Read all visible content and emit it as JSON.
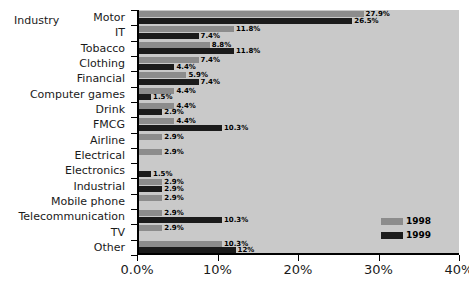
{
  "chart_data": {
    "type": "bar",
    "orientation": "horizontal",
    "title": "",
    "xlabel": "",
    "ylabel": "Industry",
    "xlim": [
      0,
      40
    ],
    "grid": false,
    "legend_position": "bottom-right",
    "xticks": [
      "0.0%",
      "10%",
      "20%",
      "30%",
      "40%"
    ],
    "xtick_values": [
      0,
      10,
      20,
      30,
      40
    ],
    "categories": [
      "Motor",
      "IT",
      "Tobacco",
      "Clothing",
      "Financial",
      "Computer games",
      "Drink",
      "FMCG",
      "Airline",
      "Electrical",
      "Electronics",
      "Industrial",
      "Mobile phone",
      "Telecommunication",
      "TV",
      "Other"
    ],
    "series": [
      {
        "name": "1998",
        "color": "#8c8c8c",
        "values": [
          27.9,
          11.8,
          8.8,
          7.4,
          5.9,
          4.4,
          4.4,
          4.4,
          2.9,
          2.9,
          null,
          2.9,
          2.9,
          2.9,
          2.9,
          10.3
        ],
        "labels": [
          "27.9%",
          "11.8%",
          "8.8%",
          "7.4%",
          "5.9%",
          "4.4%",
          "4.4%",
          "4.4%",
          "2.9%",
          "2.9%",
          "",
          "2.9%",
          "2.9%",
          "2.9%",
          "2.9%",
          "10.3%"
        ]
      },
      {
        "name": "1999",
        "color": "#1b1b1b",
        "values": [
          26.5,
          7.4,
          11.8,
          4.4,
          7.4,
          1.5,
          2.9,
          10.3,
          null,
          null,
          1.5,
          2.9,
          null,
          10.3,
          null,
          12.0
        ],
        "labels": [
          "26.5%",
          "7.4%",
          "11.8%",
          "4.4%",
          "7.4%",
          "1.5%",
          "2.9%",
          "10.3%",
          "",
          "",
          "1.5%",
          "2.9%",
          "",
          "10.3%",
          "",
          "12%"
        ]
      }
    ]
  },
  "legend": {
    "items": [
      {
        "label": "1998",
        "color": "#8c8c8c"
      },
      {
        "label": "1999",
        "color": "#1b1b1b"
      }
    ]
  },
  "colors": {
    "page_background": "#ffffff",
    "plot_background": "#c9c9c9",
    "axis": "#000000",
    "series_1998": "#8c8c8c",
    "series_1999": "#1b1b1b"
  }
}
